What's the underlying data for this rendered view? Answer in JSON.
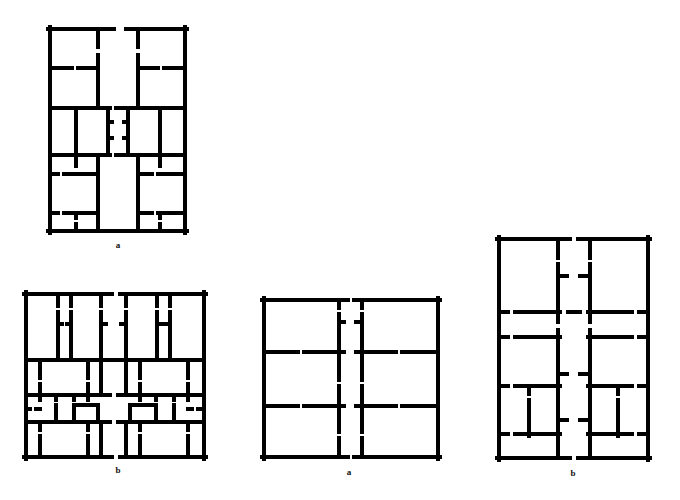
{
  "figure": {
    "background": "#ffffff",
    "wall_color": "#000000",
    "wall_thickness": 4,
    "plans": [
      {
        "id": "plan-1",
        "label": "a",
        "label_pos": [
          118,
          247
        ],
        "outline": [
          48,
          27,
          187,
          233
        ],
        "walls": [
          [
            48,
            29,
            114,
            29
          ],
          [
            126,
            29,
            187,
            29
          ],
          [
            50,
            27,
            50,
            233
          ],
          [
            185,
            27,
            185,
            233
          ],
          [
            48,
            231,
            187,
            231
          ],
          [
            98,
            29,
            98,
            47
          ],
          [
            98,
            55,
            98,
            108
          ],
          [
            138,
            29,
            138,
            47
          ],
          [
            138,
            55,
            138,
            108
          ],
          [
            50,
            68,
            72,
            68
          ],
          [
            78,
            68,
            98,
            68
          ],
          [
            138,
            68,
            158,
            68
          ],
          [
            164,
            68,
            185,
            68
          ],
          [
            50,
            108,
            110,
            108
          ],
          [
            116,
            108,
            185,
            108
          ],
          [
            76,
            108,
            76,
            155
          ],
          [
            160,
            108,
            160,
            155
          ],
          [
            108,
            108,
            108,
            118
          ],
          [
            128,
            108,
            128,
            118
          ],
          [
            108,
            124,
            108,
            135
          ],
          [
            128,
            124,
            128,
            135
          ],
          [
            108,
            141,
            108,
            155
          ],
          [
            128,
            141,
            128,
            155
          ],
          [
            108,
            122,
            112,
            122
          ],
          [
            124,
            122,
            128,
            122
          ],
          [
            108,
            138,
            112,
            138
          ],
          [
            124,
            138,
            128,
            138
          ],
          [
            50,
            155,
            110,
            155
          ],
          [
            116,
            155,
            185,
            155
          ],
          [
            98,
            155,
            98,
            172
          ],
          [
            98,
            178,
            98,
            231
          ],
          [
            138,
            155,
            138,
            172
          ],
          [
            138,
            178,
            138,
            231
          ],
          [
            76,
            155,
            76,
            166
          ],
          [
            160,
            155,
            160,
            166
          ],
          [
            50,
            174,
            58,
            174
          ],
          [
            64,
            174,
            98,
            174
          ],
          [
            138,
            174,
            152,
            174
          ],
          [
            158,
            174,
            185,
            174
          ],
          [
            50,
            213,
            58,
            213
          ],
          [
            64,
            213,
            98,
            213
          ],
          [
            138,
            213,
            152,
            213
          ],
          [
            158,
            213,
            185,
            213
          ],
          [
            76,
            213,
            76,
            218
          ],
          [
            76,
            224,
            76,
            231
          ],
          [
            160,
            213,
            160,
            218
          ],
          [
            160,
            224,
            160,
            231
          ]
        ]
      },
      {
        "id": "plan-2",
        "label": "b",
        "label_pos": [
          118,
          472
        ],
        "outline": [
          24,
          292,
          206,
          459
        ],
        "walls": [
          [
            24,
            294,
            112,
            294
          ],
          [
            120,
            294,
            206,
            294
          ],
          [
            26,
            292,
            26,
            459
          ],
          [
            204,
            292,
            204,
            459
          ],
          [
            24,
            457,
            112,
            457
          ],
          [
            120,
            457,
            206,
            457
          ],
          [
            58,
            294,
            58,
            306
          ],
          [
            58,
            312,
            58,
            360
          ],
          [
            71,
            294,
            71,
            306
          ],
          [
            71,
            312,
            71,
            360
          ],
          [
            101,
            294,
            101,
            306
          ],
          [
            101,
            312,
            101,
            360
          ],
          [
            126,
            294,
            126,
            306
          ],
          [
            126,
            312,
            126,
            360
          ],
          [
            157,
            294,
            157,
            306
          ],
          [
            157,
            312,
            157,
            360
          ],
          [
            170,
            294,
            170,
            306
          ],
          [
            170,
            312,
            170,
            360
          ],
          [
            58,
            324,
            62,
            324
          ],
          [
            67,
            324,
            71,
            324
          ],
          [
            101,
            324,
            106,
            324
          ],
          [
            121,
            324,
            126,
            324
          ],
          [
            157,
            324,
            162,
            324
          ],
          [
            166,
            324,
            170,
            324
          ],
          [
            26,
            360,
            204,
            360
          ],
          [
            40,
            360,
            40,
            378
          ],
          [
            40,
            384,
            40,
            395
          ],
          [
            88,
            360,
            88,
            378
          ],
          [
            88,
            384,
            88,
            395
          ],
          [
            101,
            360,
            101,
            395
          ],
          [
            126,
            360,
            126,
            395
          ],
          [
            140,
            360,
            140,
            378
          ],
          [
            140,
            384,
            140,
            395
          ],
          [
            188,
            360,
            188,
            378
          ],
          [
            188,
            384,
            188,
            395
          ],
          [
            26,
            395,
            110,
            395
          ],
          [
            118,
            395,
            204,
            395
          ],
          [
            40,
            395,
            40,
            400
          ],
          [
            56,
            395,
            56,
            400
          ],
          [
            74,
            395,
            74,
            400
          ],
          [
            88,
            395,
            88,
            400
          ],
          [
            140,
            395,
            140,
            400
          ],
          [
            156,
            395,
            156,
            400
          ],
          [
            174,
            395,
            174,
            400
          ],
          [
            188,
            395,
            188,
            400
          ],
          [
            26,
            409,
            30,
            409
          ],
          [
            36,
            409,
            40,
            409
          ],
          [
            188,
            409,
            192,
            409
          ],
          [
            198,
            409,
            204,
            409
          ],
          [
            74,
            405,
            98,
            405
          ],
          [
            74,
            405,
            74,
            422
          ],
          [
            98,
            405,
            98,
            422
          ],
          [
            130,
            405,
            156,
            405
          ],
          [
            130,
            405,
            130,
            422
          ],
          [
            156,
            405,
            156,
            422
          ],
          [
            56,
            405,
            56,
            420
          ],
          [
            174,
            405,
            174,
            420
          ],
          [
            26,
            422,
            110,
            422
          ],
          [
            118,
            422,
            204,
            422
          ],
          [
            40,
            422,
            40,
            430
          ],
          [
            40,
            436,
            40,
            457
          ],
          [
            88,
            422,
            88,
            430
          ],
          [
            88,
            436,
            88,
            457
          ],
          [
            140,
            422,
            140,
            430
          ],
          [
            140,
            436,
            140,
            457
          ],
          [
            188,
            422,
            188,
            430
          ],
          [
            188,
            436,
            188,
            457
          ],
          [
            101,
            422,
            101,
            457
          ],
          [
            126,
            422,
            126,
            457
          ]
        ]
      },
      {
        "id": "plan-3",
        "label": "a",
        "label_pos": [
          349,
          474
        ],
        "outline": [
          262,
          298,
          440,
          459
        ],
        "walls": [
          [
            262,
            300,
            348,
            300
          ],
          [
            354,
            300,
            440,
            300
          ],
          [
            264,
            298,
            264,
            459
          ],
          [
            438,
            298,
            438,
            459
          ],
          [
            262,
            457,
            348,
            457
          ],
          [
            354,
            457,
            440,
            457
          ],
          [
            339,
            300,
            339,
            308
          ],
          [
            339,
            314,
            339,
            350
          ],
          [
            362,
            300,
            362,
            308
          ],
          [
            362,
            314,
            362,
            350
          ],
          [
            339,
            322,
            344,
            322
          ],
          [
            356,
            322,
            362,
            322
          ],
          [
            264,
            352,
            298,
            352
          ],
          [
            304,
            352,
            344,
            352
          ],
          [
            356,
            352,
            396,
            352
          ],
          [
            402,
            352,
            438,
            352
          ],
          [
            339,
            352,
            339,
            380
          ],
          [
            339,
            386,
            339,
            404
          ],
          [
            362,
            352,
            362,
            380
          ],
          [
            362,
            386,
            362,
            404
          ],
          [
            264,
            406,
            298,
            406
          ],
          [
            304,
            406,
            344,
            406
          ],
          [
            356,
            406,
            396,
            406
          ],
          [
            402,
            406,
            438,
            406
          ],
          [
            339,
            406,
            339,
            432
          ],
          [
            339,
            438,
            339,
            457
          ],
          [
            362,
            406,
            362,
            432
          ],
          [
            362,
            438,
            362,
            457
          ]
        ]
      },
      {
        "id": "plan-4",
        "label": "b",
        "label_pos": [
          573,
          475
        ],
        "outline": [
          497,
          237,
          650,
          460
        ],
        "walls": [
          [
            497,
            239,
            570,
            239
          ],
          [
            578,
            239,
            650,
            239
          ],
          [
            499,
            237,
            499,
            460
          ],
          [
            648,
            237,
            648,
            460
          ],
          [
            497,
            458,
            570,
            458
          ],
          [
            578,
            458,
            650,
            458
          ],
          [
            558,
            239,
            558,
            258
          ],
          [
            558,
            264,
            558,
            310
          ],
          [
            590,
            239,
            590,
            258
          ],
          [
            590,
            264,
            590,
            310
          ],
          [
            558,
            276,
            567,
            276
          ],
          [
            580,
            276,
            590,
            276
          ],
          [
            499,
            312,
            508,
            312
          ],
          [
            515,
            312,
            560,
            312
          ],
          [
            568,
            312,
            580,
            312
          ],
          [
            588,
            312,
            632,
            312
          ],
          [
            639,
            312,
            648,
            312
          ],
          [
            558,
            312,
            558,
            322
          ],
          [
            590,
            312,
            590,
            322
          ],
          [
            499,
            337,
            508,
            337
          ],
          [
            515,
            337,
            560,
            337
          ],
          [
            588,
            337,
            632,
            337
          ],
          [
            639,
            337,
            648,
            337
          ],
          [
            558,
            330,
            558,
            458
          ],
          [
            590,
            330,
            590,
            458
          ],
          [
            558,
            374,
            567,
            374
          ],
          [
            580,
            374,
            590,
            374
          ],
          [
            499,
            386,
            508,
            386
          ],
          [
            515,
            386,
            560,
            386
          ],
          [
            588,
            386,
            632,
            386
          ],
          [
            639,
            386,
            648,
            386
          ],
          [
            529,
            386,
            529,
            394
          ],
          [
            529,
            400,
            529,
            436
          ],
          [
            618,
            386,
            618,
            394
          ],
          [
            618,
            400,
            618,
            436
          ],
          [
            499,
            434,
            508,
            434
          ],
          [
            515,
            434,
            560,
            434
          ],
          [
            588,
            434,
            632,
            434
          ],
          [
            639,
            434,
            648,
            434
          ],
          [
            558,
            420,
            567,
            420
          ],
          [
            580,
            420,
            590,
            420
          ]
        ]
      }
    ]
  }
}
